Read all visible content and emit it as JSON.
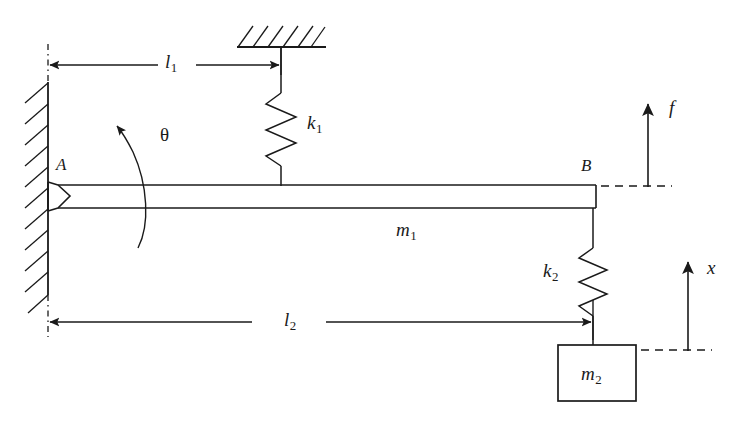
{
  "figure": {
    "type": "mechanical-schematic",
    "background_color": "#ffffff",
    "line_color": "#1a1a1a"
  },
  "labels": {
    "point_a": {
      "text": "A",
      "sub": ""
    },
    "point_b": {
      "text": "B",
      "sub": ""
    },
    "angle_theta": {
      "text": "θ",
      "sub": ""
    },
    "length_l1": {
      "text": "l",
      "sub": "1"
    },
    "length_l2": {
      "text": "l",
      "sub": "2"
    },
    "spring_k1": {
      "text": "k",
      "sub": "1"
    },
    "spring_k2": {
      "text": "k",
      "sub": "2"
    },
    "mass_m1": {
      "text": "m",
      "sub": "1"
    },
    "mass_m2": {
      "text": "m",
      "sub": "2"
    },
    "force_f": {
      "text": "f",
      "sub": ""
    },
    "displacement_x": {
      "text": "x",
      "sub": ""
    }
  },
  "elements": {
    "wall": {
      "name": "fixed-wall",
      "hatching": "diagonal-up-right",
      "orientation": "vertical"
    },
    "ceiling": {
      "name": "fixed-ceiling",
      "hatching": "diagonal-up-right",
      "orientation": "horizontal"
    },
    "beam": {
      "name": "rigid-beam",
      "mass_label": "m1"
    },
    "pin_joint": {
      "name": "pin-joint-at-a"
    },
    "spring_top": {
      "name": "spring-k1",
      "coils": 4
    },
    "spring_bottom": {
      "name": "spring-k2",
      "coils": 4
    },
    "block": {
      "name": "mass-block-m2"
    },
    "arrow_force": {
      "name": "force-arrow-f",
      "direction": "up"
    },
    "arrow_displacement": {
      "name": "displacement-arrow-x",
      "direction": "up"
    },
    "dimension_l1": {
      "name": "dimension-line-l1",
      "direction": "both"
    },
    "dimension_l2": {
      "name": "dimension-line-l2",
      "direction": "both"
    },
    "arc_theta": {
      "name": "rotation-arc-theta",
      "direction": "counterclockwise"
    },
    "centerline": {
      "name": "wall-centerline",
      "style": "dash-dot"
    }
  }
}
